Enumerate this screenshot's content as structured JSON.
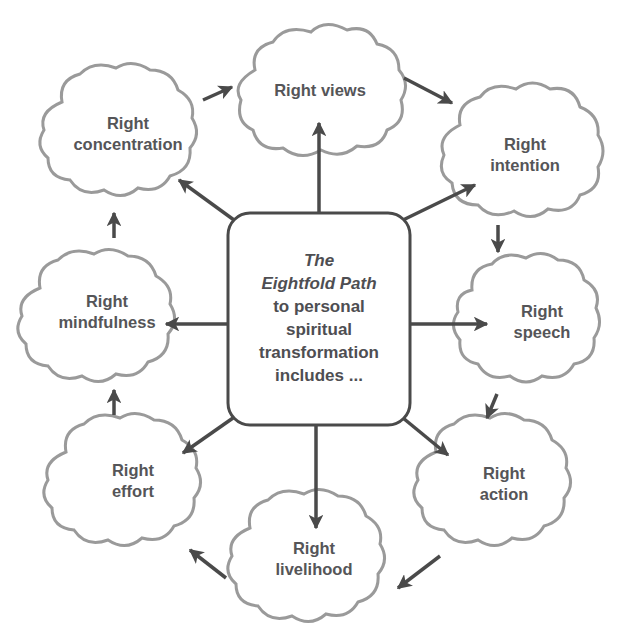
{
  "diagram": {
    "center": {
      "line1": "The",
      "line2": "Eightfold Path",
      "line3": "to personal",
      "line4": "spiritual",
      "line5": "transformation",
      "line6": "includes ..."
    },
    "nodes": [
      {
        "id": "views",
        "line1": "Right views",
        "line2": ""
      },
      {
        "id": "intention",
        "line1": "Right",
        "line2": "intention"
      },
      {
        "id": "speech",
        "line1": "Right",
        "line2": "speech"
      },
      {
        "id": "action",
        "line1": "Right",
        "line2": "action"
      },
      {
        "id": "livelihood",
        "line1": "Right",
        "line2": "livelihood"
      },
      {
        "id": "effort",
        "line1": "Right",
        "line2": "effort"
      },
      {
        "id": "mindfulness",
        "line1": "Right",
        "line2": "mindfulness"
      },
      {
        "id": "concentration",
        "line1": "Right",
        "line2": "concentration"
      }
    ],
    "colors": {
      "cloud_outline": "#9a9a9a",
      "arrow": "#4a4a4a",
      "text": "#555558",
      "background": "#ffffff"
    }
  }
}
